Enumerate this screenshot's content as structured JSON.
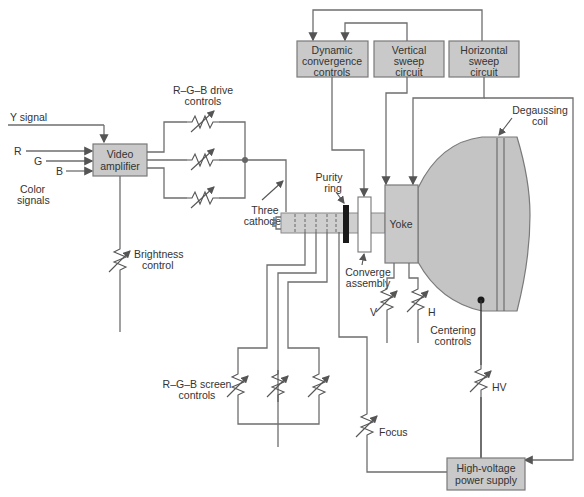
{
  "diagram": {
    "colors": {
      "box_fill": "#c9c9c9",
      "line": "#6e6e6e",
      "tube_fill": "#c4c4c4",
      "text": "#333333"
    },
    "inputs": {
      "y_signal": "Y signal",
      "r": "R",
      "g": "G",
      "b": "B",
      "color_signals_1": "Color",
      "color_signals_2": "signals"
    },
    "boxes": {
      "video_amplifier": [
        "Video",
        "amplifier"
      ],
      "dynamic_convergence": [
        "Dynamic",
        "convergence",
        "controls"
      ],
      "vertical_sweep": [
        "Vertical",
        "sweep",
        "circuit"
      ],
      "horizontal_sweep": [
        "Horizontal",
        "sweep",
        "circuit"
      ],
      "high_voltage": [
        "High-voltage",
        "power supply"
      ],
      "yoke": "Yoke"
    },
    "labels": {
      "drive_controls": [
        "R–G–B drive",
        "controls"
      ],
      "three_cathodes": [
        "Three",
        "cathodes"
      ],
      "brightness_control": [
        "Brightness",
        "control"
      ],
      "purity_ring": [
        "Purity",
        "ring"
      ],
      "converge_assembly": [
        "Converge",
        "assembly"
      ],
      "degaussing_coil": [
        "Degaussing",
        "coil"
      ],
      "v": "V",
      "h": "H",
      "centering_controls": [
        "Centering",
        "controls"
      ],
      "screen_controls": [
        "R–G–B screen",
        "controls"
      ],
      "focus": "Focus",
      "hv": "HV"
    }
  }
}
